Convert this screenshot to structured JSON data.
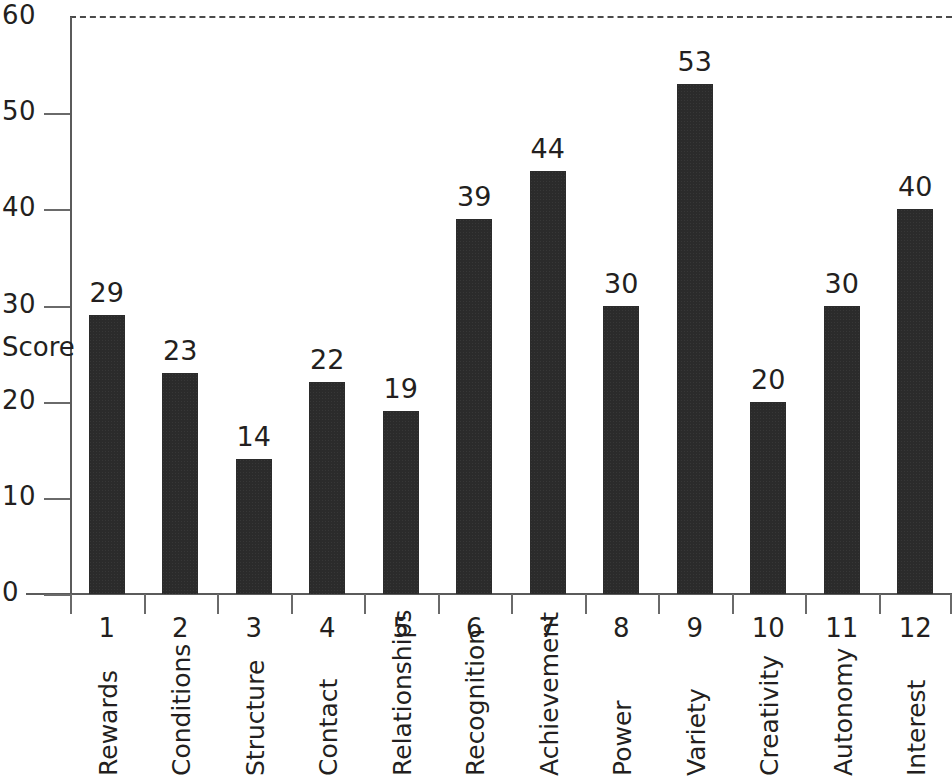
{
  "chart_data": {
    "type": "bar",
    "title": "",
    "subtitle": "",
    "xlabel": "",
    "ylabel": "Score",
    "ylim": [
      0,
      60
    ],
    "ytick_values": [
      0,
      10,
      20,
      30,
      40,
      50,
      60
    ],
    "ytick_labels": [
      "0",
      "10",
      "20",
      "30",
      "40",
      "50",
      "60"
    ],
    "grid": false,
    "legend": null,
    "annotations": [
      {
        "kind": "reference-line",
        "style": "dashed",
        "orientation": "horizontal",
        "y": 60,
        "label": ""
      }
    ],
    "categories": [
      "Rewards",
      "Conditions",
      "Structure",
      "Contact",
      "Relationships",
      "Recognition",
      "Achievement",
      "Power",
      "Variety",
      "Creativity",
      "Autonomy",
      "Interest"
    ],
    "category_numbers": [
      "1",
      "2",
      "3",
      "4",
      "5",
      "6",
      "7",
      "8",
      "9",
      "10",
      "11",
      "12"
    ],
    "values": [
      29,
      23,
      14,
      22,
      19,
      39,
      44,
      30,
      53,
      20,
      30,
      40
    ],
    "value_labels": [
      "29",
      "23",
      "14",
      "22",
      "19",
      "39",
      "44",
      "30",
      "53",
      "20",
      "30",
      "40"
    ],
    "bar_color": "#2b2b2b",
    "axis_color": "#5b5b5b",
    "text_color": "#231f20"
  }
}
